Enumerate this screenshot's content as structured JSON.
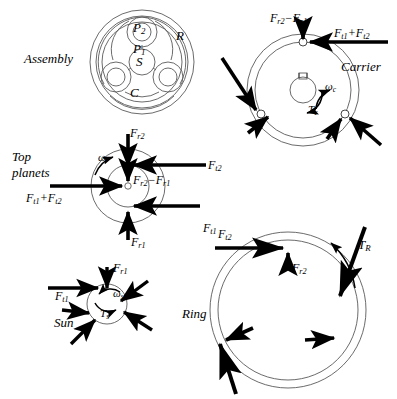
{
  "figure": {
    "type": "free-body-diagram",
    "panels": [
      "Assembly",
      "Carrier",
      "Top planets",
      "Sun",
      "Ring"
    ]
  },
  "assembly": {
    "caption": "Assembly",
    "gear_labels": [
      {
        "name": "ring-gear-label",
        "text": "R"
      },
      {
        "name": "planet2-label",
        "text": "P",
        "sub": "2"
      },
      {
        "name": "planet1-label",
        "text": "P",
        "sub": "1"
      },
      {
        "name": "sun-gear-label",
        "text": "S"
      },
      {
        "name": "carrier-label",
        "text": "C"
      }
    ]
  },
  "carrier": {
    "caption": "Carrier",
    "forces": [
      {
        "name": "radial-force-label",
        "text": "F",
        "sub": "r2",
        "text2": "−F",
        "sub2": "r1"
      },
      {
        "name": "tangential-force-label",
        "text": "F",
        "sub": "t1",
        "text2": "+F",
        "sub2": "t2"
      }
    ],
    "omega": {
      "text": "ω",
      "sub": "c"
    },
    "torque": {
      "text": "T",
      "sub": "c"
    }
  },
  "top_planets": {
    "caption_line1": "Top",
    "caption_line2": "planets",
    "forces": [
      {
        "name": "fr2-label",
        "text": "F",
        "sub": "r2"
      },
      {
        "name": "ft2-label",
        "text": "F",
        "sub": "t2"
      },
      {
        "name": "fr2-minus-fr1-label",
        "text": "F",
        "sub": "r2",
        "text2": "−F",
        "sub2": "r1"
      },
      {
        "name": "ft1-plus-ft2-label",
        "text": "F",
        "sub": "t1",
        "text2": "+F",
        "sub2": "t2"
      },
      {
        "name": "ft1-label",
        "text": "F",
        "sub": "t1"
      },
      {
        "name": "fr1-label",
        "text": "F",
        "sub": "r1"
      }
    ],
    "omega": {
      "text": "ω",
      "sub": ""
    }
  },
  "sun": {
    "caption": "Sun",
    "forces": [
      {
        "name": "fr1-label",
        "text": "F",
        "sub": "r1"
      },
      {
        "name": "ft1-label",
        "text": "F",
        "sub": "t1"
      }
    ],
    "omega": {
      "text": "ω",
      "sub": "s"
    },
    "torque": {
      "text": "T",
      "sub": "s"
    }
  },
  "ring": {
    "caption": "Ring",
    "forces": [
      {
        "name": "ft2-label",
        "text": "F",
        "sub": "t2"
      },
      {
        "name": "fr2-label",
        "text": "F",
        "sub": "r2"
      }
    ],
    "torque": {
      "text": "T",
      "sub": "R"
    }
  },
  "style": {
    "line_color": "#555555",
    "arrow_color": "#000000",
    "background": "#ffffff"
  }
}
